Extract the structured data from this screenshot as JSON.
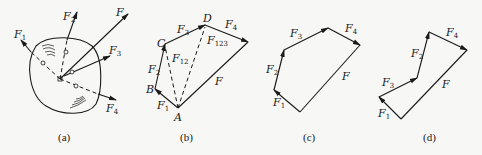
{
  "figure": {
    "panels": [
      {
        "id": "a",
        "caption": "(a)",
        "description": "Rigid body with four concurrent forces and their resultant",
        "labels": {
          "F1": "F",
          "F1_sub": "1",
          "F2": "F",
          "F2_sub": "2",
          "F3": "F",
          "F3_sub": "3",
          "F4": "F",
          "F4_sub": "4",
          "F": "F"
        }
      },
      {
        "id": "b",
        "caption": "(b)",
        "description": "Force polygon with intermediate resultants",
        "points": {
          "A": "A",
          "B": "B",
          "C": "C",
          "D": "D"
        },
        "labels": {
          "F1": "F",
          "F1_sub": "1",
          "F2": "F",
          "F2_sub": "2",
          "F3": "F",
          "F3_sub": "3",
          "F4": "F",
          "F4_sub": "4",
          "F": "F",
          "F12": "F",
          "F12_sub": "12",
          "F123": "F",
          "F123_sub": "123"
        }
      },
      {
        "id": "c",
        "caption": "(c)",
        "description": "Force polygon order F1, F2, F3, F4",
        "labels": {
          "F1": "F",
          "F1_sub": "1",
          "F2": "F",
          "F2_sub": "2",
          "F3": "F",
          "F3_sub": "3",
          "F4": "F",
          "F4_sub": "4",
          "F": "F"
        }
      },
      {
        "id": "d",
        "caption": "(d)",
        "description": "Force polygon order F1, F3, F2, F4",
        "labels": {
          "F1": "F",
          "F1_sub": "1",
          "F2": "F",
          "F2_sub": "2",
          "F3": "F",
          "F3_sub": "3",
          "F4": "F",
          "F4_sub": "4",
          "F": "F"
        }
      }
    ]
  }
}
